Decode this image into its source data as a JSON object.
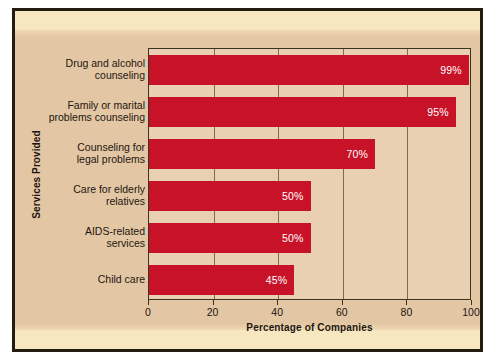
{
  "chart_data": {
    "type": "bar",
    "orientation": "horizontal",
    "title": "",
    "xlabel": "Percentage of Companies",
    "ylabel": "Services Provided",
    "categories": [
      "Drug and alcohol\ncounseling",
      "Family or marital\nproblems counseling",
      "Counseling for\nlegal problems",
      "Care for elderly\nrelatives",
      "AIDS-related\nservices",
      "Child care"
    ],
    "values": [
      99,
      95,
      70,
      50,
      50,
      45
    ],
    "value_labels": [
      "99%",
      "95%",
      "70%",
      "50%",
      "50%",
      "45%"
    ],
    "xlim": [
      0,
      100
    ],
    "xticks": [
      0,
      20,
      40,
      60,
      80,
      100
    ],
    "xtick_labels": [
      "0",
      "20",
      "40",
      "60",
      "80",
      "100"
    ],
    "grid": true,
    "legend": false,
    "bar_color": "#c81228",
    "plot_background": "#e9d0b2",
    "panel_background": "#e3c7a5",
    "border_color": "#241c13"
  }
}
